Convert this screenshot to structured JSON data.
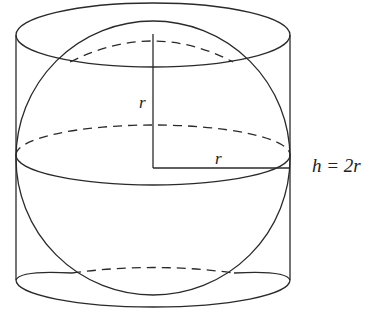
{
  "figure": {
    "labels": {
      "vertical_radius": "r",
      "horizontal_radius": "r",
      "height_equation": "h = 2r"
    },
    "colors": {
      "line": "#2a2a2a",
      "background": "#ffffff"
    }
  }
}
